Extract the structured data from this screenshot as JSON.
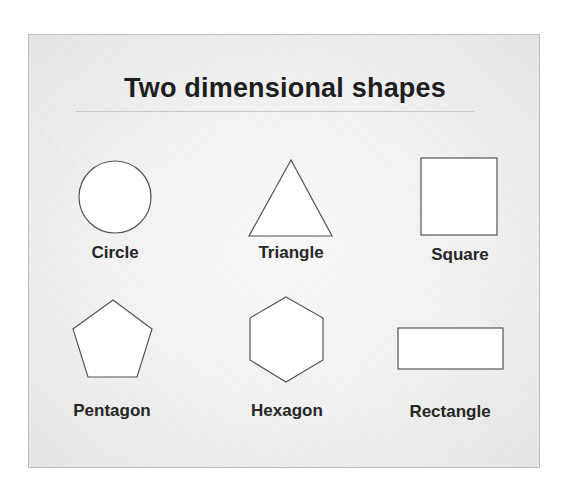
{
  "title": "Two dimensional shapes",
  "colors": {
    "stroke": "#555555",
    "fill": "#ffffff",
    "text": "#1e1e1e"
  },
  "shapes": [
    {
      "name": "circle",
      "label": "Circle"
    },
    {
      "name": "triangle",
      "label": "Triangle"
    },
    {
      "name": "square",
      "label": "Square"
    },
    {
      "name": "pentagon",
      "label": "Pentagon"
    },
    {
      "name": "hexagon",
      "label": "Hexagon"
    },
    {
      "name": "rectangle",
      "label": "Rectangle"
    }
  ]
}
